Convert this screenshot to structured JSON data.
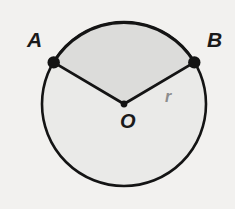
{
  "figure": {
    "kind": "circle-sector-diagram",
    "background_color": "#f2f1ef",
    "stroke_color": "#141414",
    "sector_fill": "#dcdcda",
    "circle_fill": "#eaeae8",
    "radius_label_color": "#8d8d8d",
    "geometry": {
      "center_x": 124,
      "center_y": 104,
      "radius": 82,
      "stroke_width": 2.6,
      "point_radius": 6,
      "point_a": {
        "x": 53,
        "y": 62,
        "angle_deg": 149
      },
      "point_b": {
        "x": 195,
        "y": 62,
        "angle_deg": 31
      },
      "sector_angle_deg": 118
    }
  },
  "labels": {
    "point_a": "A",
    "point_b": "B",
    "center": "O",
    "radius": "r"
  }
}
